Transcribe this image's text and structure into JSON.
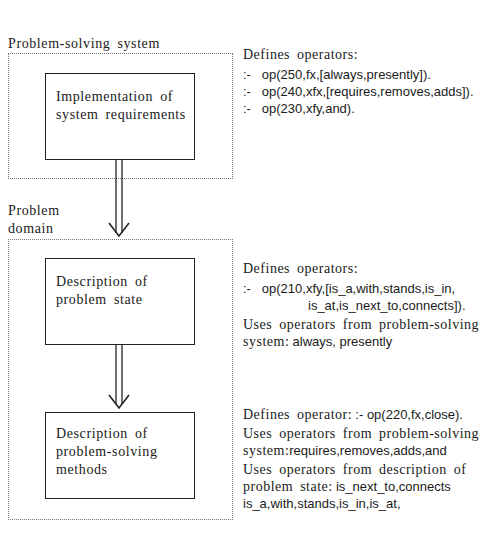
{
  "sections": {
    "problem_solving_system": {
      "label": "Problem-solving  system",
      "box": {
        "line1": "Implementation  of",
        "line2": "system  requirements"
      },
      "note": {
        "heading": "Defines  operators:",
        "ops": [
          {
            "prefix": ":-",
            "code": "op(250,fx,[always,presently])."
          },
          {
            "prefix": ":-",
            "code": "op(240,xfx,[requires,removes,adds])."
          },
          {
            "prefix": ":-",
            "code": "op(230,xfy,and)."
          }
        ]
      }
    },
    "problem_domain": {
      "label_line1": "Problem",
      "label_line2": "domain",
      "state_box": {
        "line1": "Description  of",
        "line2": "problem  state"
      },
      "state_note": {
        "heading": "Defines  operators:",
        "op_prefix": ":-",
        "op_line1": "op(210,xfy,[is_a,with,stands,is_in,",
        "op_line2": "is_at,is_next_to,connects]).",
        "uses_line1": "Uses  operators  from  problem-solving",
        "uses_line2_serif": "system:",
        "uses_line2_sans": "always,  presently"
      },
      "methods_box": {
        "line1": "Description  of",
        "line2": "problem-solving",
        "line3": "methods"
      },
      "methods_note": {
        "defines_serif": "Defines  operator:",
        "defines_sans": ":-  op(220,fx,close).",
        "uses1_line1": "Uses  operators  from  problem-solving",
        "uses1_line2_serif": "system:",
        "uses1_line2_sans": "requires,removes,adds,and",
        "uses2_line1": "Uses  operators  from  description  of",
        "uses2_line2_serif": "problem  state:",
        "uses2_line2_sans": "is_next_to,connects",
        "uses2_line3": "is_a,with,stands,is_in,is_at,"
      }
    }
  },
  "arrows": [
    {
      "from": "implementation-box",
      "to": "problem-domain-box"
    },
    {
      "from": "problem-state-box",
      "to": "problem-solving-methods-box"
    }
  ]
}
